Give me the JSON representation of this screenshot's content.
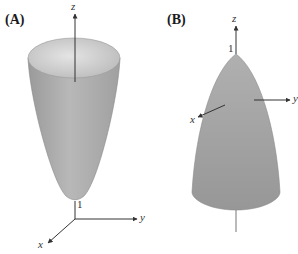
{
  "panels": [
    {
      "label": "(A)",
      "description": "upward-opening paraboloid with vertex at z=1",
      "axes": {
        "z": "z",
        "y": "y",
        "x": "x"
      },
      "tick": "1"
    },
    {
      "label": "(B)",
      "description": "downward-opening paraboloid with vertex at z=1",
      "axes": {
        "z": "z",
        "y": "y",
        "x": "x"
      },
      "tick": "1"
    }
  ],
  "colors": {
    "surface": "#a9a9a9",
    "surface_light": "#d2d2d2",
    "surface_dark": "#8c8c8c",
    "axis": "#333333"
  }
}
